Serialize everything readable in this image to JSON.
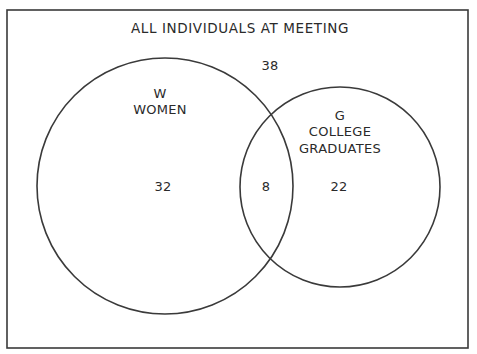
{
  "diagram": {
    "type": "venn",
    "universe_label": "ALL INDIVIDUALS AT MEETING",
    "outside_count": "38",
    "sets": [
      {
        "letter": "W",
        "name": "WOMEN",
        "only_count": "32"
      },
      {
        "letter": "G",
        "name_line1": "COLLEGE",
        "name_line2": "GRADUATES",
        "only_count": "22"
      }
    ],
    "intersection_count": "8",
    "colors": {
      "stroke": "#3a3a3a",
      "background": "#ffffff",
      "text": "#2a2a2a"
    }
  }
}
